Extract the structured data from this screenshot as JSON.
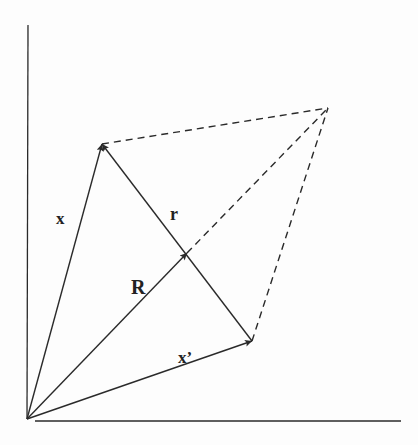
{
  "diagram": {
    "type": "vector-diagram",
    "colors": {
      "ink": "#2a2a2a",
      "background": "#fdfdfd"
    },
    "axes": {
      "origin": [
        27,
        419
      ],
      "y_axis_top": [
        28,
        25
      ],
      "x_axis_end": [
        401,
        421
      ]
    },
    "points": {
      "O": [
        27,
        419
      ],
      "x_tip": [
        102,
        144
      ],
      "R_tip": [
        187,
        253
      ],
      "xp_tip": [
        252,
        341
      ],
      "far": [
        328,
        108
      ]
    },
    "vectors": [
      {
        "id": "x",
        "label": "x",
        "from": "O",
        "to": "x_tip"
      },
      {
        "id": "R",
        "label": "R",
        "from": "O",
        "to": "R_tip"
      },
      {
        "id": "xp",
        "label": "x’",
        "from": "O",
        "to": "xp_tip"
      },
      {
        "id": "r",
        "label": "r",
        "from": "xp_tip",
        "to": "x_tip"
      }
    ],
    "dashed": [
      {
        "from": "x_tip",
        "to": "far"
      },
      {
        "from": "R_tip",
        "to": "far"
      },
      {
        "from": "xp_tip",
        "to": "far"
      }
    ],
    "labels": {
      "x": {
        "text": "x",
        "pos": [
          56,
          224
        ],
        "size": 17
      },
      "r": {
        "text": "r",
        "pos": [
          170,
          220
        ],
        "size": 18
      },
      "R": {
        "text": "R",
        "pos": [
          131,
          294
        ],
        "size": 20
      },
      "xp": {
        "text": "x’",
        "pos": [
          178,
          363
        ],
        "size": 17
      }
    }
  }
}
